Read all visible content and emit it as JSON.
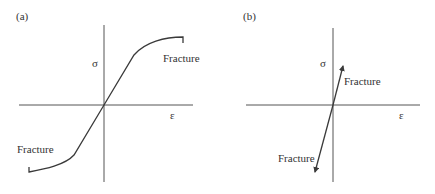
{
  "figure": {
    "panels": [
      {
        "id": "a",
        "label": "(a)",
        "y_axis_symbol": "σ",
        "x_axis_symbol": "ε",
        "annotations": {
          "upper": "Fracture",
          "lower": "Fracture"
        },
        "description": "Ductile stress-strain curve: linear through origin, then yielding and work hardening to fracture in both tension and compression"
      },
      {
        "id": "b",
        "label": "(b)",
        "y_axis_symbol": "σ",
        "x_axis_symbol": "ε",
        "annotations": {
          "upper": "Fracture",
          "lower": "Fracture"
        },
        "description": "Brittle stress-strain curve: linear through origin to fracture in both tension and compression"
      }
    ],
    "colors": {
      "line": "#3a3a3a",
      "axis": "#555555",
      "background": "#ffffff"
    }
  }
}
